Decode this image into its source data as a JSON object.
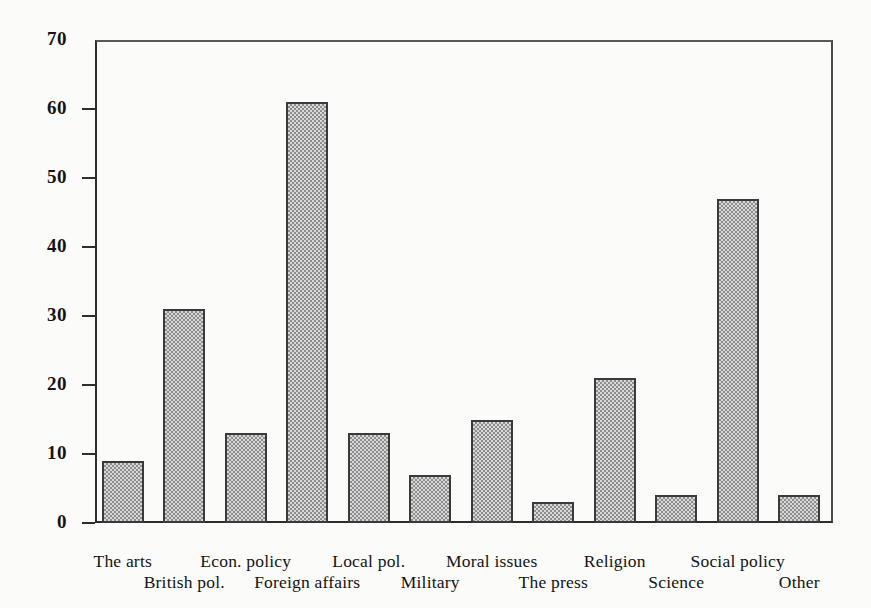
{
  "chart_data": {
    "type": "bar",
    "title": "",
    "subtitle": "",
    "xlabel": "",
    "ylabel": "",
    "ylim": [
      0,
      70
    ],
    "yticks": [
      0,
      10,
      20,
      30,
      40,
      50,
      60,
      70
    ],
    "ytick_labels": [
      "0",
      "10",
      "20",
      "30",
      "40",
      "50",
      "60",
      "70"
    ],
    "grid": false,
    "legend": false,
    "legend_position": "none",
    "bar_fill_color": "#b9b9b9",
    "bar_edge_color": "#3a3a3a",
    "background_color": "#fbfbf9",
    "axis_color": "#2e2e2e",
    "categories": [
      "The arts",
      "British pol.",
      "Econ. policy",
      "Foreign affairs",
      "Local pol.",
      "Military",
      "Moral issues",
      "The press",
      "Religion",
      "Science",
      "Social policy",
      "Other"
    ],
    "values": [
      9,
      31,
      13,
      61,
      13,
      7,
      15,
      3,
      21,
      4,
      47,
      4
    ],
    "label_rows": [
      "top",
      "bottom",
      "top",
      "bottom",
      "top",
      "bottom",
      "top",
      "bottom",
      "top",
      "bottom",
      "top",
      "bottom"
    ]
  }
}
